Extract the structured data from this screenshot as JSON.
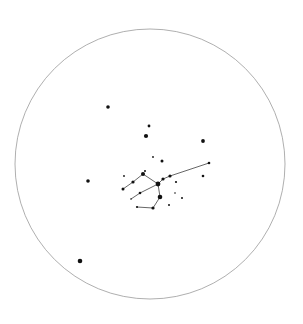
{
  "star_chart": {
    "canvas": {
      "width": 303,
      "height": 324
    },
    "boundary": {
      "cx": 150,
      "cy": 164,
      "r": 135
    },
    "colors": {
      "background": "#ffffff",
      "boundary": "#9a9a9a",
      "star": "#111111",
      "line": "#555555"
    },
    "stars": [
      {
        "id": "s1",
        "x": 108,
        "y": 107,
        "size": 1.8
      },
      {
        "id": "s2",
        "x": 149,
        "y": 126,
        "size": 1.4
      },
      {
        "id": "s3",
        "x": 146,
        "y": 136,
        "size": 2.1
      },
      {
        "id": "s4",
        "x": 203,
        "y": 141,
        "size": 1.9
      },
      {
        "id": "s5",
        "x": 153,
        "y": 157,
        "size": 0.9
      },
      {
        "id": "s6",
        "x": 162,
        "y": 161,
        "size": 1.5
      },
      {
        "id": "s7",
        "x": 209,
        "y": 163,
        "size": 1.3
      },
      {
        "id": "s8",
        "x": 145,
        "y": 171,
        "size": 1.0
      },
      {
        "id": "s9",
        "x": 143,
        "y": 174,
        "size": 2.0
      },
      {
        "id": "s10",
        "x": 124,
        "y": 176,
        "size": 0.9
      },
      {
        "id": "s11",
        "x": 170,
        "y": 176,
        "size": 1.6
      },
      {
        "id": "s12",
        "x": 203,
        "y": 176,
        "size": 1.3
      },
      {
        "id": "s13",
        "x": 163,
        "y": 179,
        "size": 1.6
      },
      {
        "id": "s14",
        "x": 88,
        "y": 181,
        "size": 1.8
      },
      {
        "id": "s15",
        "x": 133,
        "y": 182,
        "size": 1.6
      },
      {
        "id": "s16",
        "x": 176,
        "y": 182,
        "size": 1.1
      },
      {
        "id": "s17",
        "x": 158,
        "y": 184,
        "size": 2.4
      },
      {
        "id": "s18",
        "x": 123,
        "y": 189,
        "size": 1.5
      },
      {
        "id": "s19",
        "x": 140,
        "y": 193,
        "size": 1.3
      },
      {
        "id": "s20",
        "x": 175,
        "y": 193,
        "size": 0.8
      },
      {
        "id": "s21",
        "x": 160,
        "y": 197,
        "size": 2.3
      },
      {
        "id": "s22",
        "x": 131,
        "y": 199,
        "size": 0.8
      },
      {
        "id": "s23",
        "x": 182,
        "y": 198,
        "size": 1.0
      },
      {
        "id": "s24",
        "x": 169,
        "y": 205,
        "size": 1.0
      },
      {
        "id": "s25",
        "x": 137,
        "y": 207,
        "size": 1.1
      },
      {
        "id": "s26",
        "x": 153,
        "y": 208,
        "size": 1.6
      },
      {
        "id": "s27",
        "x": 80,
        "y": 261,
        "size": 2.3
      }
    ],
    "lines": [
      {
        "from": "s18",
        "to": "s15"
      },
      {
        "from": "s15",
        "to": "s9"
      },
      {
        "from": "s9",
        "to": "s17"
      },
      {
        "from": "s17",
        "to": "s13"
      },
      {
        "from": "s13",
        "to": "s11"
      },
      {
        "from": "s11",
        "to": "s7"
      },
      {
        "from": "s17",
        "to": "s21"
      },
      {
        "from": "s21",
        "to": "s26"
      },
      {
        "from": "s26",
        "to": "s25"
      },
      {
        "from": "s17",
        "to": "s19"
      },
      {
        "from": "s19",
        "to": "s22"
      }
    ]
  }
}
